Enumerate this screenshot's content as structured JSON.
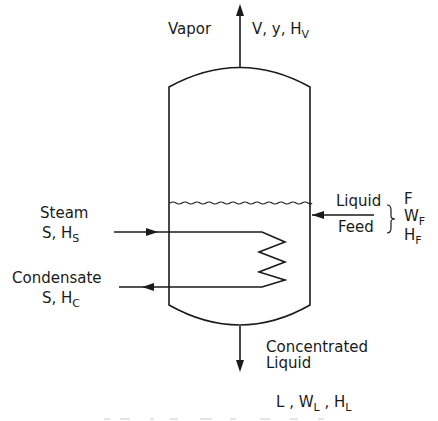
{
  "vapor": {
    "label": "Vapor",
    "vars": [
      "V",
      "y",
      "H"
    ],
    "h_sub": "V"
  },
  "steam": {
    "label": "Steam",
    "var": "S",
    "h": "H",
    "h_sub": "S"
  },
  "condensate": {
    "label": "Condensate",
    "var": "S",
    "h": "H",
    "h_sub": "C"
  },
  "feed": {
    "line1": "Liquid",
    "line2": "Feed",
    "vars": [
      {
        "main": "F",
        "sub": ""
      },
      {
        "main": "W",
        "sub": "F"
      },
      {
        "main": "H",
        "sub": "F"
      }
    ]
  },
  "product": {
    "line1": "Concentrated",
    "line2": "Liquid",
    "vars": [
      {
        "main": "L",
        "sub": ""
      },
      {
        "main": "W",
        "sub": "L"
      },
      {
        "main": "H",
        "sub": "L"
      }
    ]
  },
  "colors": {
    "line": "#1a1a1a",
    "background": "#ffffff"
  }
}
